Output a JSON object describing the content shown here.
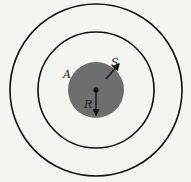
{
  "diagram": {
    "labels": {
      "A": "A",
      "S": "S",
      "R": "R"
    },
    "colors": {
      "background": "#f4f4f2",
      "disk": "#6e6e6e",
      "stroke": "#111111"
    },
    "circles": [
      {
        "name": "outer-ring",
        "cx": 96,
        "cy": 90,
        "r": 86
      },
      {
        "name": "inner-ring",
        "cx": 96,
        "cy": 90,
        "r": 58
      },
      {
        "name": "source-disk",
        "cx": 96,
        "cy": 90,
        "r": 28
      }
    ]
  }
}
